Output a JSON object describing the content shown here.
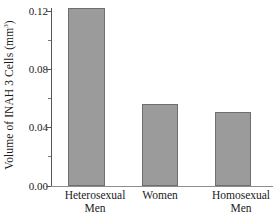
{
  "chart_data": {
    "type": "bar",
    "title": "",
    "xlabel": "",
    "ylabel": "Volume of INAH 3 Cells (mm",
    "ylabel_sup": "3",
    "ylabel_tail": ")",
    "categories": [
      "Heterosexual Men",
      "Women",
      "Homosexual Men"
    ],
    "category_lines": [
      [
        "Heterosexual",
        "Men"
      ],
      [
        "Women",
        ""
      ],
      [
        "Homosexual",
        "Men"
      ]
    ],
    "values": [
      0.12,
      0.055,
      0.05
    ],
    "ylim": [
      0.0,
      0.12
    ],
    "ytick_values": [
      0.12,
      0.08,
      0.04,
      0.0
    ],
    "ytick_labels": [
      "0.12",
      "0.08",
      "0.04",
      "0.00"
    ],
    "yminor_values": [
      0.1,
      0.06,
      0.02
    ],
    "grid": false,
    "legend": false,
    "legend_position": "none",
    "bar_color": "#9b9b9b",
    "bar_edge_color": "#6f6f6f",
    "axis_color": "#555555",
    "background": "#ffffff"
  }
}
